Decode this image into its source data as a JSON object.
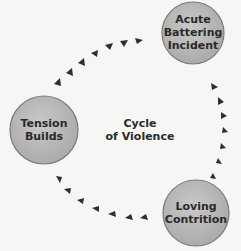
{
  "diagram": {
    "title_line1": "Cycle",
    "title_line2": "of Violence",
    "nodes": [
      {
        "line1": "Acute",
        "line2": "Battering",
        "line3": "Incident"
      },
      {
        "line1": "Tension",
        "line2": "Builds"
      },
      {
        "line1": "Loving",
        "line2": "Contrition"
      }
    ],
    "colors": {
      "circle_fill": "#b8b8b8",
      "circle_stroke": "#7a7a7a",
      "arrow": "#2e2e2e",
      "background": "#f6f6f4"
    }
  }
}
